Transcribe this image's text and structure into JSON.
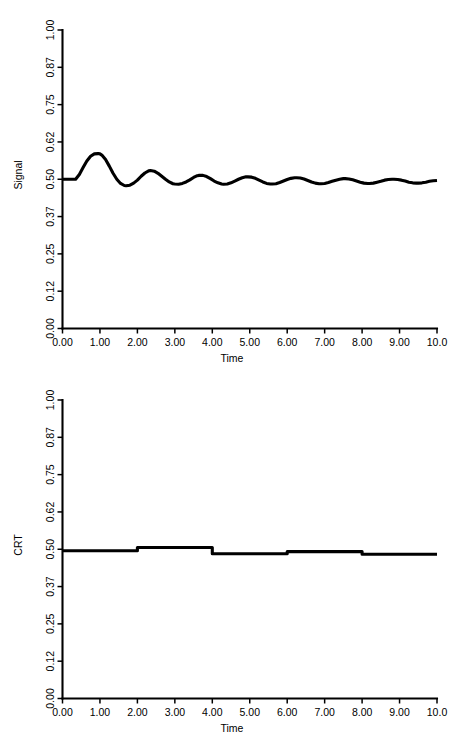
{
  "figure": {
    "width": 454,
    "height": 740,
    "background": "#ffffff",
    "line_color": "#000000",
    "panels": 2
  },
  "chart_data": [
    {
      "type": "line",
      "title": "",
      "xlabel": "Time",
      "ylabel": "Signal",
      "xlim": [
        0.0,
        10.0
      ],
      "ylim": [
        0.0,
        1.0
      ],
      "grid": false,
      "legend": null,
      "xticks": [
        0.0,
        1.0,
        2.0,
        3.0,
        4.0,
        5.0,
        6.0,
        7.0,
        8.0,
        9.0,
        10.0
      ],
      "xticklabels": [
        "0.00",
        "1.00",
        "2.00",
        "3.00",
        "4.00",
        "5.00",
        "6.00",
        "7.00",
        "8.00",
        "9.00",
        "10.0"
      ],
      "yticks": [
        0.0,
        0.125,
        0.25,
        0.375,
        0.5,
        0.625,
        0.75,
        0.875,
        1.0
      ],
      "yticklabels": [
        "0.00",
        "0.12",
        "0.25",
        "0.37",
        "0.50",
        "0.62",
        "0.75",
        "0.87",
        "1.00"
      ],
      "series": [
        {
          "name": "Signal",
          "x": [
            0.0,
            0.1,
            0.2,
            0.3,
            0.35,
            0.45,
            0.55,
            0.65,
            0.75,
            0.85,
            0.95,
            1.0,
            1.05,
            1.15,
            1.25,
            1.35,
            1.45,
            1.55,
            1.65,
            1.7,
            1.8,
            1.9,
            2.0,
            2.1,
            2.2,
            2.3,
            2.35,
            2.45,
            2.55,
            2.65,
            2.75,
            2.85,
            2.95,
            3.0,
            3.1,
            3.2,
            3.3,
            3.4,
            3.5,
            3.6,
            3.65,
            3.75,
            3.85,
            3.95,
            4.05,
            4.15,
            4.25,
            4.3,
            4.4,
            4.5,
            4.6,
            4.7,
            4.8,
            4.9,
            4.95,
            5.05,
            5.15,
            5.25,
            5.35,
            5.45,
            5.55,
            5.6,
            5.7,
            5.8,
            5.9,
            6.0,
            6.1,
            6.2,
            6.25,
            6.35,
            6.45,
            6.55,
            6.65,
            6.75,
            6.85,
            6.9,
            7.0,
            7.1,
            7.2,
            7.3,
            7.4,
            7.5,
            7.55,
            7.65,
            7.75,
            7.85,
            7.95,
            8.05,
            8.15,
            8.2,
            8.3,
            8.4,
            8.5,
            8.6,
            8.7,
            8.8,
            8.85,
            8.95,
            9.05,
            9.15,
            9.25,
            9.35,
            9.45,
            9.5,
            9.6,
            9.7,
            9.8,
            9.9,
            10.0
          ],
          "y": [
            0.5,
            0.5,
            0.5,
            0.5,
            0.5,
            0.516,
            0.539,
            0.561,
            0.577,
            0.585,
            0.586,
            0.585,
            0.581,
            0.566,
            0.544,
            0.52,
            0.5,
            0.486,
            0.479,
            0.478,
            0.48,
            0.487,
            0.497,
            0.51,
            0.521,
            0.528,
            0.529,
            0.527,
            0.52,
            0.51,
            0.5,
            0.491,
            0.485,
            0.484,
            0.483,
            0.486,
            0.491,
            0.498,
            0.506,
            0.512,
            0.513,
            0.513,
            0.509,
            0.502,
            0.494,
            0.488,
            0.484,
            0.483,
            0.484,
            0.488,
            0.494,
            0.5,
            0.505,
            0.508,
            0.508,
            0.507,
            0.503,
            0.497,
            0.491,
            0.486,
            0.484,
            0.484,
            0.485,
            0.489,
            0.494,
            0.499,
            0.503,
            0.505,
            0.505,
            0.504,
            0.501,
            0.496,
            0.491,
            0.487,
            0.485,
            0.485,
            0.486,
            0.489,
            0.493,
            0.497,
            0.5,
            0.502,
            0.502,
            0.501,
            0.498,
            0.494,
            0.49,
            0.487,
            0.486,
            0.486,
            0.487,
            0.49,
            0.493,
            0.497,
            0.499,
            0.5,
            0.5,
            0.499,
            0.497,
            0.494,
            0.49,
            0.488,
            0.487,
            0.487,
            0.488,
            0.49,
            0.493,
            0.495,
            0.496
          ]
        }
      ]
    },
    {
      "type": "line",
      "title": "",
      "xlabel": "Time",
      "ylabel": "CRT",
      "xlim": [
        0.0,
        10.0
      ],
      "ylim": [
        0.0,
        1.0
      ],
      "grid": false,
      "legend": null,
      "drawstyle": "steps-post",
      "xticks": [
        0.0,
        1.0,
        2.0,
        3.0,
        4.0,
        5.0,
        6.0,
        7.0,
        8.0,
        9.0,
        10.0
      ],
      "xticklabels": [
        "0.00",
        "1.00",
        "2.00",
        "3.00",
        "4.00",
        "5.00",
        "6.00",
        "7.00",
        "8.00",
        "9.00",
        "10.0"
      ],
      "yticks": [
        0.0,
        0.125,
        0.25,
        0.375,
        0.5,
        0.625,
        0.75,
        0.875,
        1.0
      ],
      "yticklabels": [
        "0.00",
        "0.12",
        "0.25",
        "0.37",
        "0.50",
        "0.62",
        "0.75",
        "0.87",
        "1.00"
      ],
      "series": [
        {
          "name": "CRT",
          "x": [
            0.0,
            2.0,
            4.0,
            6.0,
            8.0,
            10.0
          ],
          "y": [
            0.495,
            0.506,
            0.485,
            0.492,
            0.483,
            0.483
          ]
        }
      ]
    }
  ]
}
